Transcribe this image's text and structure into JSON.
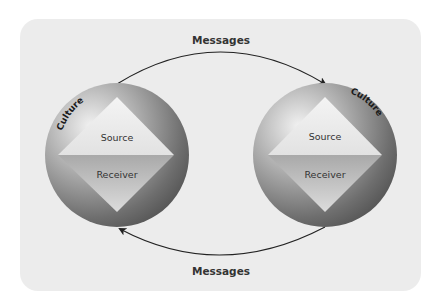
{
  "diagram": {
    "type": "communication-model",
    "top_arrow": {
      "label": "Messages",
      "direction": "left-to-right"
    },
    "bottom_arrow": {
      "label": "Messages",
      "direction": "right-to-left"
    },
    "nodes": [
      {
        "id": "left",
        "culture_label": "Culture",
        "top_label": "Source",
        "bottom_label": "Receiver"
      },
      {
        "id": "right",
        "culture_label": "Culture",
        "top_label": "Source",
        "bottom_label": "Receiver"
      }
    ],
    "colors": {
      "panel": "#ececec",
      "circle_light": "#d8d8d8",
      "circle_dark": "#585858",
      "diamond_top": "#e9e9e9",
      "diamond_bottom": "#b9b9b9",
      "arrow": "#222222"
    }
  }
}
